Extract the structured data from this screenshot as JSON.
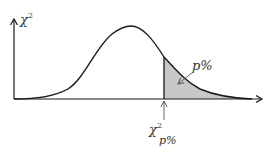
{
  "diagram": {
    "y_axis_label": "χ",
    "y_axis_label_sup": "2",
    "tail_label": "p%",
    "critical_value_label": "χ",
    "critical_value_sup": "2",
    "critical_value_sub": "p%",
    "colors": {
      "curve": "#1a1a1a",
      "axis": "#1a1a1a",
      "shaded_region": "#c8c8c8",
      "background": "#ffffff",
      "arrow": "#555555"
    }
  }
}
